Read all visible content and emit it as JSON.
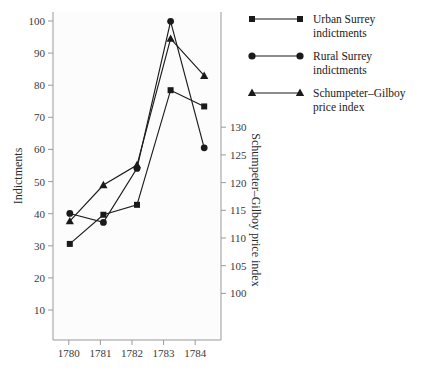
{
  "chart_data": {
    "type": "line",
    "title": "",
    "subtitle": "",
    "xlabel": "",
    "ylabel": "Indictments",
    "y2label": "Schumpeter–Gilboy price index",
    "x": [
      1780,
      1781,
      1782,
      1783,
      1784
    ],
    "xtick_labels": [
      "1780",
      "1781",
      "1782",
      "1783",
      "1784"
    ],
    "xlim": [
      1779.5,
      1784.5
    ],
    "ylim": [
      5,
      104
    ],
    "yticks": [
      10,
      20,
      30,
      40,
      50,
      60,
      70,
      80,
      90,
      100
    ],
    "ytick_labels": [
      "10",
      "20",
      "30",
      "40",
      "50",
      "60",
      "70",
      "80",
      "90",
      "100"
    ],
    "y2lim": [
      97.5,
      132
    ],
    "y2ticks": [
      100,
      105,
      110,
      115,
      120,
      125,
      130
    ],
    "y2tick_labels": [
      "100",
      "105",
      "110",
      "115",
      "120",
      "125",
      "130"
    ],
    "grid": false,
    "legend_position": "right",
    "series": [
      {
        "name": "Urban Surrey indictments",
        "label_line1": "Urban Surrey",
        "label_line2": "indictments",
        "marker": "square",
        "axis": "left",
        "color": "#1a1a1a",
        "values": [
          34,
          42.8,
          45.8,
          80.4,
          75.5
        ]
      },
      {
        "name": "Rural Surrey indictments",
        "label_line1": "Rural Surrey",
        "label_line2": "indictments",
        "marker": "circle",
        "axis": "left",
        "color": "#1a1a1a",
        "values": [
          43.2,
          40.5,
          56.8,
          101.2,
          63
        ]
      },
      {
        "name": "Schumpeter–Gilboy price index",
        "label_line1": "Schumpeter–Gilboy",
        "label_line2": "price index",
        "marker": "triangle",
        "axis": "right",
        "color": "#3a3a3a",
        "values": [
          110,
          113.8,
          115.9,
          129.2,
          125.3
        ]
      }
    ]
  },
  "legend": {
    "items": [
      {
        "line1": "Urban Surrey",
        "line2": "indictments",
        "marker": "square-marker-icon"
      },
      {
        "line1": "Rural Surrey",
        "line2": "indictments",
        "marker": "circle-marker-icon"
      },
      {
        "line1": "Schumpeter–Gilboy",
        "line2": "price index",
        "marker": "triangle-marker-icon"
      }
    ]
  },
  "colors": {
    "ink": "#1a1a1a",
    "axis": "#9a9a9a",
    "tick_text": "#3a3a3a",
    "plot_bg": "#fcfcfc",
    "page_bg": "#ffffff"
  }
}
